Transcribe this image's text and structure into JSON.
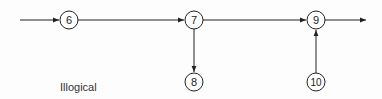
{
  "diagram": {
    "caption": "Illogical",
    "colors": {
      "line": "#222222",
      "node_fill": "#ffffff",
      "background": "#fdfdfd"
    },
    "nodes": [
      {
        "id": "6",
        "label": "6",
        "cx": 69,
        "cy": 20
      },
      {
        "id": "7",
        "label": "7",
        "cx": 194,
        "cy": 20
      },
      {
        "id": "9",
        "label": "9",
        "cx": 316,
        "cy": 20
      },
      {
        "id": "8",
        "label": "8",
        "cx": 194,
        "cy": 82
      },
      {
        "id": "10",
        "label": "10",
        "cx": 316,
        "cy": 82
      }
    ],
    "edges": [
      {
        "from": "start",
        "to": "6"
      },
      {
        "from": "6",
        "to": "7"
      },
      {
        "from": "7",
        "to": "9"
      },
      {
        "from": "7",
        "to": "8"
      },
      {
        "from": "10",
        "to": "9"
      },
      {
        "from": "9",
        "to": "end"
      }
    ]
  }
}
